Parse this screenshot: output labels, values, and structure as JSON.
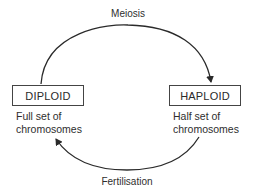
{
  "diagram": {
    "type": "life-cycle",
    "processes": {
      "top": {
        "label": "Meiosis",
        "from": "DIPLOID",
        "to": "HAPLOID"
      },
      "bottom": {
        "label": "Fertilisation",
        "from": "HAPLOID",
        "to": "DIPLOID"
      }
    },
    "states": [
      {
        "label": "DIPLOID",
        "description": [
          "Full set of",
          "chromosomes"
        ]
      },
      {
        "label": "HAPLOID",
        "description": [
          "Half set of",
          "chromosomes"
        ]
      }
    ],
    "colors": {
      "stroke": "#2a2a2a",
      "text": "#2e2e2e",
      "background": "#ffffff"
    }
  }
}
